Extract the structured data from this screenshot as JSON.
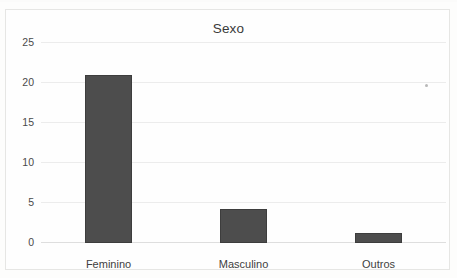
{
  "chart_data": {
    "type": "bar",
    "title": "Sexo",
    "xlabel": "",
    "ylabel": "",
    "categories": [
      "Feminino",
      "Masculino",
      "Outros"
    ],
    "values": [
      21,
      4.2,
      1.3
    ],
    "series": [
      {
        "name": "Sexo",
        "values": [
          21,
          4.2,
          1.3
        ]
      }
    ],
    "ylim": [
      0,
      25
    ],
    "ytick_labels": [
      "0",
      "5",
      "10",
      "15",
      "20",
      "25"
    ],
    "ytick_values": [
      0,
      5,
      10,
      15,
      20,
      25
    ],
    "grid": true,
    "legend": false,
    "legend_position": "none",
    "bar_color": "#4d4d4d",
    "gridline_color": "#ececec",
    "background_color": "#fefefe"
  },
  "figure": {
    "title_text": "Sexo",
    "frame_border_color": "#e6e6e4",
    "page_background": "#fdfdfc"
  }
}
